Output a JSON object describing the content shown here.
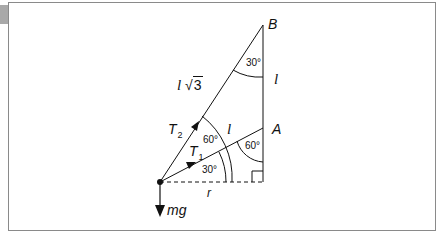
{
  "diagram": {
    "points": {
      "B": "B",
      "A": "A"
    },
    "lengths": {
      "BA": "l",
      "mass_to_A": "l",
      "mass_to_B_prefix": "l",
      "mass_to_B_root": "3",
      "horizontal": "r"
    },
    "forces": {
      "T2": {
        "symbol": "T",
        "sub": "2"
      },
      "T1": {
        "symbol": "T",
        "sub": "1"
      },
      "weight": "mg"
    },
    "angles": {
      "at_B": "30°",
      "at_A": "60°",
      "between_T2_horizontal": "60°",
      "between_T1_horizontal": "30°"
    },
    "colors": {
      "line": "#111111",
      "frame": "#8a8a8a",
      "tab": "#a9a9a9"
    }
  }
}
